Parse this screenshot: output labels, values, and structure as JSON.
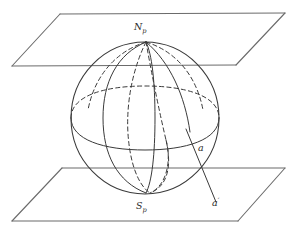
{
  "figure": {
    "background_color": "#ffffff",
    "line_color": "#3a3a3a",
    "plane_line_color": "#6b6b6b",
    "label_color": "#2b2b2b"
  },
  "labels": {
    "north_pole": {
      "base": "N",
      "subscript": "p"
    },
    "south_pole": {
      "base": "S",
      "subscript": "p"
    },
    "line_upper": {
      "base": "a",
      "prime": ""
    },
    "line_lower": {
      "base": "a",
      "prime": "′"
    }
  },
  "geometry": {
    "sphere": {
      "center_x": 145,
      "center_y": 118,
      "radius_x": 74,
      "radius_y": 76
    },
    "top_plane": {
      "points": "60,14 285,13 236,65 12,66"
    },
    "bottom_plane": {
      "points": "62,168 285,168 238,221 12,221"
    },
    "secant_line": {
      "x1": 186,
      "y1": 129,
      "x2": 216,
      "y2": 202
    }
  }
}
